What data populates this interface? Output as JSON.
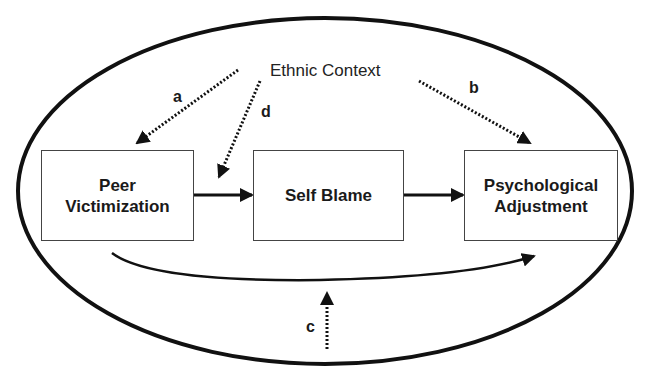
{
  "diagram": {
    "context_label": "Ethnic Context",
    "nodes": [
      {
        "id": "peer",
        "label_line1": "Peer",
        "label_line2": "Victimization"
      },
      {
        "id": "blame",
        "label": "Self Blame"
      },
      {
        "id": "psych",
        "label_line1": "Psychological",
        "label_line2": "Adjustment"
      }
    ],
    "path_labels": {
      "a": "a",
      "b": "b",
      "c": "c",
      "d": "d"
    },
    "edges": [
      {
        "from": "Peer Victimization",
        "to": "Self Blame",
        "style": "solid"
      },
      {
        "from": "Self Blame",
        "to": "Psychological Adjustment",
        "style": "solid"
      },
      {
        "from": "Peer Victimization",
        "to": "Psychological Adjustment",
        "style": "solid-curved"
      },
      {
        "from": "Ethnic Context",
        "to": "Peer Victimization",
        "style": "dotted",
        "label": "a"
      },
      {
        "from": "Ethnic Context",
        "to": "Psychological Adjustment",
        "style": "dotted",
        "label": "b"
      },
      {
        "from": "Ethnic Context",
        "to": "direct path",
        "style": "dotted",
        "label": "c"
      },
      {
        "from": "Ethnic Context",
        "to": "Peer->SelfBlame path",
        "style": "dotted",
        "label": "d"
      }
    ],
    "colors": {
      "line": "#111111",
      "box_border": "#444444",
      "background": "#ffffff"
    }
  }
}
